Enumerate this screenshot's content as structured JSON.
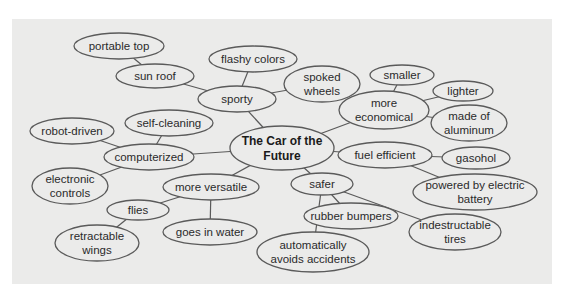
{
  "diagram": {
    "type": "cluster-map",
    "center": {
      "id": "center",
      "label": [
        "The Car of the",
        "Future"
      ],
      "cx": 282,
      "cy": 148,
      "rx": 52,
      "ry": 22
    },
    "nodes": [
      {
        "id": "portable-top",
        "label": [
          "portable top"
        ],
        "cx": 119,
        "cy": 46,
        "rx": 45,
        "ry": 13
      },
      {
        "id": "sun-roof",
        "label": [
          "sun roof"
        ],
        "cx": 155,
        "cy": 76,
        "rx": 39,
        "ry": 12
      },
      {
        "id": "flashy-colors",
        "label": [
          "flashy colors"
        ],
        "cx": 253,
        "cy": 59,
        "rx": 44,
        "ry": 13
      },
      {
        "id": "sporty",
        "label": [
          "sporty"
        ],
        "cx": 237,
        "cy": 99,
        "rx": 39,
        "ry": 13
      },
      {
        "id": "spoked-wheels",
        "label": [
          "spoked",
          "wheels"
        ],
        "cx": 322,
        "cy": 84,
        "rx": 38,
        "ry": 18
      },
      {
        "id": "smaller",
        "label": [
          "smaller"
        ],
        "cx": 402,
        "cy": 75,
        "rx": 32,
        "ry": 10
      },
      {
        "id": "lighter",
        "label": [
          "lighter"
        ],
        "cx": 463,
        "cy": 91,
        "rx": 30,
        "ry": 10
      },
      {
        "id": "more-economical",
        "label": [
          "more",
          "economical"
        ],
        "cx": 384,
        "cy": 110,
        "rx": 45,
        "ry": 19
      },
      {
        "id": "made-of-aluminum",
        "label": [
          "made of",
          "aluminum"
        ],
        "cx": 469,
        "cy": 123,
        "rx": 38,
        "ry": 18
      },
      {
        "id": "self-cleaning",
        "label": [
          "self-cleaning"
        ],
        "cx": 169,
        "cy": 123,
        "rx": 44,
        "ry": 13
      },
      {
        "id": "robot-driven",
        "label": [
          "robot-driven"
        ],
        "cx": 72,
        "cy": 131,
        "rx": 42,
        "ry": 13
      },
      {
        "id": "computerized",
        "label": [
          "computerized"
        ],
        "cx": 149,
        "cy": 157,
        "rx": 45,
        "ry": 13
      },
      {
        "id": "fuel-efficient",
        "label": [
          "fuel efficient"
        ],
        "cx": 385,
        "cy": 155,
        "rx": 47,
        "ry": 13
      },
      {
        "id": "gasohol",
        "label": [
          "gasohol"
        ],
        "cx": 476,
        "cy": 158,
        "rx": 34,
        "ry": 11
      },
      {
        "id": "electronic-controls",
        "label": [
          "electronic",
          "controls"
        ],
        "cx": 70,
        "cy": 186,
        "rx": 38,
        "ry": 18
      },
      {
        "id": "more-versatile",
        "label": [
          "more versatile"
        ],
        "cx": 211,
        "cy": 187,
        "rx": 48,
        "ry": 13
      },
      {
        "id": "safer",
        "label": [
          "safer"
        ],
        "cx": 322,
        "cy": 184,
        "rx": 31,
        "ry": 11
      },
      {
        "id": "powered-by-electric-battery",
        "label": [
          "powered by electric",
          "battery"
        ],
        "cx": 475,
        "cy": 192,
        "rx": 62,
        "ry": 18
      },
      {
        "id": "flies",
        "label": [
          "flies"
        ],
        "cx": 138,
        "cy": 210,
        "rx": 31,
        "ry": 10
      },
      {
        "id": "rubber-bumpers",
        "label": [
          "rubber bumpers"
        ],
        "cx": 351,
        "cy": 216,
        "rx": 47,
        "ry": 13
      },
      {
        "id": "goes-in-water",
        "label": [
          "goes in water"
        ],
        "cx": 210,
        "cy": 232,
        "rx": 47,
        "ry": 13
      },
      {
        "id": "retractable-wings",
        "label": [
          "retractable",
          "wings"
        ],
        "cx": 97,
        "cy": 243,
        "rx": 42,
        "ry": 18
      },
      {
        "id": "indestructable-tires",
        "label": [
          "indestructable",
          "tires"
        ],
        "cx": 455,
        "cy": 232,
        "rx": 46,
        "ry": 18
      },
      {
        "id": "automatically-avoids-accidents",
        "label": [
          "automatically",
          "avoids accidents"
        ],
        "cx": 313,
        "cy": 252,
        "rx": 56,
        "ry": 20
      }
    ],
    "edges": [
      [
        "portable-top",
        "sun-roof"
      ],
      [
        "sun-roof",
        "sporty"
      ],
      [
        "flashy-colors",
        "sporty"
      ],
      [
        "sporty",
        "spoked-wheels"
      ],
      [
        "sporty",
        "center"
      ],
      [
        "smaller",
        "more-economical"
      ],
      [
        "lighter",
        "more-economical"
      ],
      [
        "made-of-aluminum",
        "more-economical"
      ],
      [
        "more-economical",
        "center"
      ],
      [
        "self-cleaning",
        "computerized"
      ],
      [
        "robot-driven",
        "computerized"
      ],
      [
        "electronic-controls",
        "computerized"
      ],
      [
        "computerized",
        "center"
      ],
      [
        "fuel-efficient",
        "center"
      ],
      [
        "fuel-efficient",
        "gasohol"
      ],
      [
        "fuel-efficient",
        "powered-by-electric-battery"
      ],
      [
        "more-versatile",
        "center"
      ],
      [
        "more-versatile",
        "flies"
      ],
      [
        "more-versatile",
        "goes-in-water"
      ],
      [
        "flies",
        "retractable-wings"
      ],
      [
        "safer",
        "center"
      ],
      [
        "safer",
        "rubber-bumpers"
      ],
      [
        "safer",
        "indestructable-tires"
      ],
      [
        "safer",
        "automatically-avoids-accidents"
      ]
    ]
  }
}
